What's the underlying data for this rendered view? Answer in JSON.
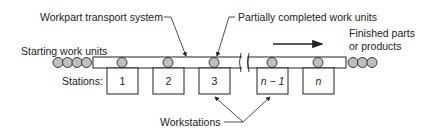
{
  "diagram": {
    "type": "flow-line production schematic",
    "labels": {
      "transport_system": "Workpart transport system",
      "partial_units": "Partially completed work units",
      "starting_units": "Starting work units",
      "finished_line1": "Finished parts",
      "finished_line2": "or products",
      "stations_prefix": "Stations:",
      "workstations": "Workstations"
    },
    "stations": [
      {
        "label": "1"
      },
      {
        "label": "2"
      },
      {
        "label": "3"
      },
      {
        "label": "n − 1"
      },
      {
        "label": "n"
      }
    ],
    "flow_direction": "left-to-right",
    "starting_unit_count": 4,
    "finished_unit_count": 3,
    "units_on_line": 5,
    "colors": {
      "line": "#222222",
      "unit_fill": "#bfbfbf",
      "background": "#ffffff"
    }
  }
}
